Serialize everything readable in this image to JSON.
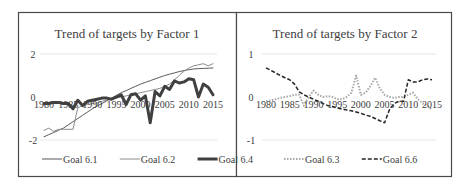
{
  "chart_data": [
    {
      "type": "line",
      "title": "Trend of targets by Factor 1",
      "xlabel": "",
      "ylabel": "",
      "ylim": [
        -2,
        2
      ],
      "yticks": [
        "2",
        "0",
        "-2"
      ],
      "xticks": [
        "1980",
        "1985",
        "1990",
        "1995",
        "2000",
        "2005",
        "2010",
        "2015"
      ],
      "grid": true,
      "legend_position": "bottom",
      "x": [
        1980,
        1981,
        1982,
        1983,
        1984,
        1985,
        1986,
        1987,
        1988,
        1989,
        1990,
        1991,
        1992,
        1993,
        1994,
        1995,
        1996,
        1997,
        1998,
        1999,
        2000,
        2001,
        2002,
        2003,
        2004,
        2005,
        2006,
        2007,
        2008,
        2009,
        2010,
        2011,
        2012,
        2013,
        2014,
        2015
      ],
      "series": [
        {
          "name": "Goal 6.1",
          "color": "#595959",
          "width": 1,
          "values": [
            -1.85,
            -1.75,
            -1.65,
            -1.55,
            -1.45,
            -1.3,
            -1.15,
            -1.0,
            -0.85,
            -0.7,
            -0.55,
            -0.42,
            -0.3,
            -0.18,
            -0.05,
            0.08,
            0.2,
            0.3,
            0.4,
            0.5,
            0.6,
            0.68,
            0.76,
            0.84,
            0.92,
            1.0,
            1.06,
            1.12,
            1.18,
            1.23,
            1.27,
            1.3,
            1.32,
            1.33,
            1.34,
            1.35
          ]
        },
        {
          "name": "Goal 6.2",
          "color": "#8c8c8c",
          "width": 1,
          "values": [
            -1.55,
            -1.45,
            -1.6,
            -1.5,
            -1.5,
            -1.5,
            -1.5,
            -0.5,
            -0.4,
            -0.35,
            -0.3,
            -0.28,
            -0.2,
            -0.15,
            -0.1,
            -0.05,
            0.0,
            0.05,
            0.1,
            0.15,
            0.2,
            0.25,
            0.3,
            0.35,
            0.4,
            0.5,
            0.6,
            0.8,
            1.0,
            1.2,
            1.35,
            1.45,
            1.5,
            1.55,
            1.45,
            1.55
          ]
        },
        {
          "name": "Goal 6.4",
          "color": "#404040",
          "width": 3,
          "values": [
            -0.3,
            -0.3,
            -0.25,
            -0.25,
            -0.3,
            -0.3,
            -0.55,
            -0.15,
            -0.4,
            -0.2,
            -0.15,
            -0.1,
            -0.05,
            -0.05,
            -0.1,
            0.0,
            0.1,
            -0.35,
            0.1,
            0.15,
            -0.15,
            0.05,
            -1.2,
            0.25,
            0.05,
            0.5,
            0.35,
            0.75,
            0.65,
            0.7,
            0.85,
            0.8,
            0.0,
            0.6,
            0.45,
            0.1
          ]
        }
      ]
    },
    {
      "type": "line",
      "title": "Trend of targets by Factor 2",
      "xlabel": "",
      "ylabel": "",
      "ylim": [
        -1,
        1
      ],
      "yticks": [
        "1",
        "0",
        "-1"
      ],
      "xticks": [
        "1980",
        "1985",
        "1990",
        "1995",
        "2000",
        "2005",
        "2010",
        "2015"
      ],
      "grid": true,
      "legend_position": "bottom",
      "x": [
        1980,
        1981,
        1982,
        1983,
        1984,
        1985,
        1986,
        1987,
        1988,
        1989,
        1990,
        1991,
        1992,
        1993,
        1994,
        1995,
        1996,
        1997,
        1998,
        1999,
        2000,
        2001,
        2002,
        2003,
        2004,
        2005,
        2006,
        2007,
        2008,
        2009,
        2010,
        2011,
        2012,
        2013,
        2014,
        2015
      ],
      "series": [
        {
          "name": "Goal 6.3",
          "color": "#a6a6a6",
          "dash": "dotted",
          "width": 2,
          "values": [
            -0.1,
            -0.08,
            -0.05,
            -0.02,
            0.0,
            0.02,
            0.05,
            0.05,
            -0.2,
            0.0,
            0.15,
            0.05,
            0.0,
            0.02,
            0.0,
            -0.05,
            -0.05,
            0.0,
            0.1,
            0.5,
            0.05,
            0.1,
            0.25,
            0.45,
            0.2,
            0.05,
            0.0,
            -0.02,
            0.0,
            0.0,
            0.05,
            0.1,
            -0.05,
            -0.15,
            -0.2,
            -0.3
          ]
        },
        {
          "name": "Goal 6.6",
          "color": "#262626",
          "dash": "dashed",
          "width": 1.5,
          "values": [
            0.68,
            0.62,
            0.56,
            0.5,
            0.45,
            0.4,
            0.3,
            0.12,
            0.05,
            0.0,
            -0.05,
            -0.1,
            -0.15,
            -0.2,
            -0.22,
            -0.25,
            -0.28,
            -0.3,
            -0.32,
            -0.35,
            -0.38,
            -0.42,
            -0.45,
            -0.5,
            -0.55,
            -0.6,
            -0.3,
            -0.15,
            -0.1,
            -0.1,
            0.4,
            0.35,
            0.35,
            0.4,
            0.42,
            0.4
          ]
        }
      ]
    }
  ]
}
